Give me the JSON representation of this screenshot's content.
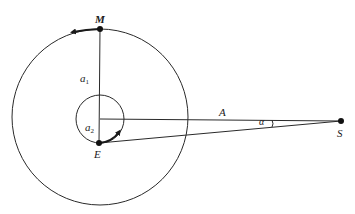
{
  "diagram": {
    "type": "orbital-geometry",
    "colors": {
      "line": "#2a2a2a",
      "background": "#ffffff"
    },
    "big_circle": {
      "cx": 100,
      "cy": 117,
      "r": 88
    },
    "small_circle": {
      "cx": 100,
      "cy": 119,
      "r": 24
    },
    "points": {
      "M": {
        "label": "M",
        "x": 100,
        "y": 29
      },
      "E": {
        "label": "E",
        "x": 99,
        "y": 143
      },
      "S": {
        "label": "S",
        "x": 341,
        "y": 121
      }
    },
    "labels": {
      "M": "M",
      "E": "E",
      "S": "S",
      "A": "A",
      "alpha": "α",
      "a1_base": "a",
      "a1_sub": "1",
      "a2_base": "a",
      "a2_sub": "2"
    },
    "segments": [
      {
        "name": "a1",
        "from": "M",
        "to": "center"
      },
      {
        "name": "a2",
        "from": "center",
        "to": "E"
      },
      {
        "name": "A",
        "from": "center",
        "to": "S"
      },
      {
        "name": "ES",
        "from": "E",
        "to": "S"
      }
    ],
    "arrows": [
      {
        "name": "moon-motion",
        "on": "big_circle",
        "direction": "counterclockwise"
      },
      {
        "name": "earth-motion",
        "on": "small_circle",
        "direction": "counterclockwise"
      }
    ]
  }
}
